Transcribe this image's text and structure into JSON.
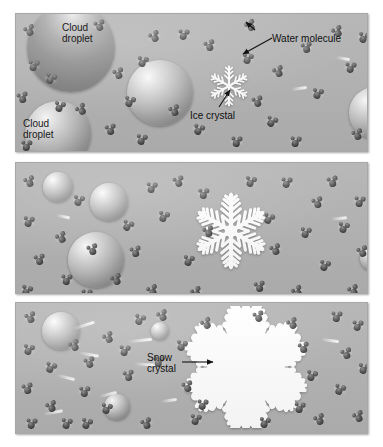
{
  "figure": {
    "type": "three-panel sequence diagram",
    "background_color": "#ffffff",
    "panel_fill": "#b3b3b3",
    "molecule_color": "#3c3c3c",
    "crystal_color": "#ffffff"
  },
  "panels": [
    {
      "id": "panel-1",
      "stage": "1",
      "caption": "Supercooled cloud droplets and water molecules surround a tiny ice crystal",
      "labels": [
        {
          "id": "cloud-droplet-1",
          "text": "Cloud\ndroplet",
          "line1": "Cloud",
          "line2": "droplet",
          "x": 62,
          "y": 22,
          "on_sphere": true,
          "font_size": 10
        },
        {
          "id": "cloud-droplet-2",
          "text": "Cloud\ndroplet",
          "line1": "Cloud",
          "line2": "droplet",
          "x": 23,
          "y": 118,
          "on_sphere": true,
          "font_size": 10
        },
        {
          "id": "water-molecule",
          "text": "Water molecule",
          "line1": "Water molecule",
          "line2": "",
          "x": 272,
          "y": 33,
          "on_sphere": false,
          "font_size": 10
        },
        {
          "id": "ice-crystal",
          "text": "Ice crystal",
          "line1": "Ice crystal",
          "line2": "",
          "x": 190,
          "y": 110,
          "on_sphere": false,
          "font_size": 10
        }
      ],
      "droplets": [
        {
          "cx": 70,
          "cy": 47,
          "r": 44,
          "shade": "bigdark"
        },
        {
          "cx": 159,
          "cy": 92,
          "r": 33,
          "shade": "light"
        },
        {
          "cx": 57,
          "cy": 133,
          "r": 33,
          "shade": "light"
        },
        {
          "cx": 374,
          "cy": 112,
          "r": 26,
          "shade": "light"
        }
      ],
      "crystal": {
        "cx": 228,
        "cy": 85,
        "size": 46,
        "kind": "simple-star"
      }
    },
    {
      "id": "panel-2",
      "stage": "2",
      "caption": "Droplets evaporate while the ice crystal grows by deposition",
      "labels": [],
      "droplets": [
        {
          "cx": 57,
          "cy": 186,
          "r": 15,
          "shade": "light"
        },
        {
          "cx": 108,
          "cy": 201,
          "r": 19,
          "shade": "light"
        },
        {
          "cx": 95,
          "cy": 259,
          "r": 28,
          "shade": "light"
        },
        {
          "cx": 372,
          "cy": 257,
          "r": 13,
          "shade": "light"
        }
      ],
      "crystal": {
        "cx": 230,
        "cy": 230,
        "size": 78,
        "kind": "dendrite"
      }
    },
    {
      "id": "panel-3",
      "stage": "3",
      "caption": "Droplets shrink to nothing as the large snow crystal forms",
      "labels": [
        {
          "id": "snow-crystal",
          "text": "Snow\ncrystal",
          "line1": "Snow",
          "line2": "crystal",
          "x": 147,
          "y": 352,
          "on_sphere": false,
          "font_size": 10
        }
      ],
      "droplets": [
        {
          "cx": 60,
          "cy": 330,
          "r": 19,
          "shade": "light"
        },
        {
          "cx": 159,
          "cy": 330,
          "r": 9,
          "shade": "light"
        },
        {
          "cx": 116,
          "cy": 406,
          "r": 13,
          "shade": "light"
        },
        {
          "cx": 376,
          "cy": 338,
          "r": 8,
          "shade": "light"
        }
      ],
      "crystal": {
        "cx": 245,
        "cy": 366,
        "size": 122,
        "kind": "stellar-dendrite"
      }
    }
  ],
  "geometry": {
    "panel_rects": [
      {
        "x": 15,
        "y": 13,
        "w": 353,
        "h": 139
      },
      {
        "x": 15,
        "y": 162,
        "w": 353,
        "h": 132
      },
      {
        "x": 15,
        "y": 302,
        "w": 353,
        "h": 132
      }
    ]
  },
  "leaders": [
    {
      "id": "leader-water-molecule",
      "x1": 272,
      "y1": 38,
      "x2": 243,
      "y2": 54,
      "head": "down-left"
    },
    {
      "id": "leader-water-molecule-2",
      "x1": 255,
      "y1": 30,
      "x2": 246,
      "y2": 22,
      "head": "up-left"
    },
    {
      "id": "leader-ice-crystal",
      "x1": 219,
      "y1": 107,
      "x2": 230,
      "y2": 90,
      "head": "up-right"
    },
    {
      "id": "leader-snow-crystal",
      "x1": 182,
      "y1": 362,
      "x2": 213,
      "y2": 362,
      "head": "right"
    }
  ],
  "molecules": {
    "panel1": [
      {
        "x": 23,
        "y": 25,
        "r": -18
      },
      {
        "x": 27,
        "y": 60,
        "r": 12
      },
      {
        "x": 16,
        "y": 92,
        "r": -8
      },
      {
        "x": 44,
        "y": 73,
        "r": 24
      },
      {
        "x": 75,
        "y": 104,
        "r": -30
      },
      {
        "x": 20,
        "y": 140,
        "r": 6
      },
      {
        "x": 53,
        "y": 101,
        "r": 18
      },
      {
        "x": 112,
        "y": 68,
        "r": -14
      },
      {
        "x": 123,
        "y": 96,
        "r": 20
      },
      {
        "x": 104,
        "y": 124,
        "r": -6
      },
      {
        "x": 135,
        "y": 134,
        "r": 14
      },
      {
        "x": 148,
        "y": 31,
        "r": -22
      },
      {
        "x": 177,
        "y": 29,
        "r": 10
      },
      {
        "x": 168,
        "y": 105,
        "r": -16
      },
      {
        "x": 192,
        "y": 124,
        "r": 22
      },
      {
        "x": 203,
        "y": 40,
        "r": -12
      },
      {
        "x": 230,
        "y": 136,
        "r": 8
      },
      {
        "x": 244,
        "y": 20,
        "r": -26
      },
      {
        "x": 241,
        "y": 53,
        "r": 16
      },
      {
        "x": 251,
        "y": 96,
        "r": -10
      },
      {
        "x": 265,
        "y": 116,
        "r": 26
      },
      {
        "x": 272,
        "y": 66,
        "r": -20
      },
      {
        "x": 289,
        "y": 136,
        "r": 12
      },
      {
        "x": 300,
        "y": 42,
        "r": -6
      },
      {
        "x": 311,
        "y": 88,
        "r": 18
      },
      {
        "x": 331,
        "y": 26,
        "r": -24
      },
      {
        "x": 344,
        "y": 62,
        "r": 10
      },
      {
        "x": 351,
        "y": 129,
        "r": -14
      },
      {
        "x": 357,
        "y": 32,
        "r": 20
      },
      {
        "x": 93,
        "y": 20,
        "r": -10
      },
      {
        "x": 136,
        "y": 56,
        "r": 16
      }
    ],
    "panel2": [
      {
        "x": 23,
        "y": 176,
        "r": -16
      },
      {
        "x": 22,
        "y": 216,
        "r": 14
      },
      {
        "x": 33,
        "y": 254,
        "r": -6
      },
      {
        "x": 20,
        "y": 285,
        "r": 22
      },
      {
        "x": 55,
        "y": 232,
        "r": -24
      },
      {
        "x": 60,
        "y": 274,
        "r": 8
      },
      {
        "x": 72,
        "y": 195,
        "r": 18
      },
      {
        "x": 86,
        "y": 244,
        "r": -12
      },
      {
        "x": 80,
        "y": 289,
        "r": 10
      },
      {
        "x": 110,
        "y": 274,
        "r": -20
      },
      {
        "x": 121,
        "y": 220,
        "r": 26
      },
      {
        "x": 129,
        "y": 246,
        "r": -8
      },
      {
        "x": 145,
        "y": 182,
        "r": 12
      },
      {
        "x": 146,
        "y": 285,
        "r": -18
      },
      {
        "x": 157,
        "y": 211,
        "r": 20
      },
      {
        "x": 172,
        "y": 176,
        "r": -10
      },
      {
        "x": 182,
        "y": 255,
        "r": 16
      },
      {
        "x": 190,
        "y": 287,
        "r": -22
      },
      {
        "x": 197,
        "y": 188,
        "r": 6
      },
      {
        "x": 202,
        "y": 226,
        "r": -14
      },
      {
        "x": 244,
        "y": 176,
        "r": 18
      },
      {
        "x": 253,
        "y": 281,
        "r": -6
      },
      {
        "x": 262,
        "y": 213,
        "r": 24
      },
      {
        "x": 269,
        "y": 244,
        "r": -16
      },
      {
        "x": 280,
        "y": 177,
        "r": 10
      },
      {
        "x": 291,
        "y": 286,
        "r": -26
      },
      {
        "x": 299,
        "y": 227,
        "r": 14
      },
      {
        "x": 311,
        "y": 197,
        "r": -12
      },
      {
        "x": 318,
        "y": 260,
        "r": 20
      },
      {
        "x": 326,
        "y": 176,
        "r": -8
      },
      {
        "x": 337,
        "y": 222,
        "r": 16
      },
      {
        "x": 347,
        "y": 285,
        "r": -20
      },
      {
        "x": 353,
        "y": 196,
        "r": 12
      },
      {
        "x": 356,
        "y": 246,
        "r": -14
      }
    ],
    "panel3": [
      {
        "x": 24,
        "y": 312,
        "r": -14
      },
      {
        "x": 22,
        "y": 344,
        "r": 18
      },
      {
        "x": 21,
        "y": 383,
        "r": -8
      },
      {
        "x": 25,
        "y": 418,
        "r": 10
      },
      {
        "x": 44,
        "y": 362,
        "r": 24
      },
      {
        "x": 45,
        "y": 401,
        "r": -18
      },
      {
        "x": 60,
        "y": 418,
        "r": 14
      },
      {
        "x": 68,
        "y": 340,
        "r": -22
      },
      {
        "x": 78,
        "y": 386,
        "r": 6
      },
      {
        "x": 80,
        "y": 418,
        "r": 20
      },
      {
        "x": 83,
        "y": 357,
        "r": -10
      },
      {
        "x": 100,
        "y": 403,
        "r": 16
      },
      {
        "x": 102,
        "y": 332,
        "r": -24
      },
      {
        "x": 118,
        "y": 345,
        "r": 12
      },
      {
        "x": 122,
        "y": 370,
        "r": -6
      },
      {
        "x": 133,
        "y": 314,
        "r": 22
      },
      {
        "x": 140,
        "y": 418,
        "r": -16
      },
      {
        "x": 152,
        "y": 356,
        "r": 8
      },
      {
        "x": 156,
        "y": 310,
        "r": -20
      },
      {
        "x": 175,
        "y": 340,
        "r": 18
      },
      {
        "x": 181,
        "y": 381,
        "r": -12
      },
      {
        "x": 189,
        "y": 414,
        "r": 14
      },
      {
        "x": 200,
        "y": 318,
        "r": -26
      },
      {
        "x": 196,
        "y": 399,
        "r": 10
      },
      {
        "x": 252,
        "y": 311,
        "r": -10
      },
      {
        "x": 258,
        "y": 417,
        "r": 16
      },
      {
        "x": 286,
        "y": 318,
        "r": -22
      },
      {
        "x": 293,
        "y": 402,
        "r": 12
      },
      {
        "x": 297,
        "y": 342,
        "r": -6
      },
      {
        "x": 305,
        "y": 370,
        "r": 20
      },
      {
        "x": 313,
        "y": 414,
        "r": -18
      },
      {
        "x": 330,
        "y": 311,
        "r": 8
      },
      {
        "x": 333,
        "y": 384,
        "r": 24
      },
      {
        "x": 340,
        "y": 348,
        "r": -14
      },
      {
        "x": 351,
        "y": 320,
        "r": 10
      },
      {
        "x": 352,
        "y": 411,
        "r": -20
      },
      {
        "x": 357,
        "y": 363,
        "r": 16
      }
    ]
  },
  "trails": [
    {
      "panel": 3,
      "x": 72,
      "y": 323,
      "w": 22,
      "r": -18
    },
    {
      "panel": 3,
      "x": 78,
      "y": 352,
      "w": 20,
      "r": 10
    },
    {
      "panel": 3,
      "x": 127,
      "y": 338,
      "w": 24,
      "r": -6
    },
    {
      "panel": 3,
      "x": 56,
      "y": 375,
      "w": 18,
      "r": 14
    },
    {
      "panel": 3,
      "x": 42,
      "y": 410,
      "w": 20,
      "r": -10
    },
    {
      "panel": 3,
      "x": 133,
      "y": 362,
      "w": 22,
      "r": 4
    },
    {
      "panel": 3,
      "x": 98,
      "y": 392,
      "w": 18,
      "r": -14
    },
    {
      "panel": 3,
      "x": 320,
      "y": 338,
      "w": 18,
      "r": 8
    },
    {
      "panel": 3,
      "x": 160,
      "y": 398,
      "w": 16,
      "r": -8
    },
    {
      "panel": 1,
      "x": 290,
      "y": 86,
      "w": 16,
      "r": -8
    },
    {
      "panel": 1,
      "x": 335,
      "y": 56,
      "w": 14,
      "r": 10
    },
    {
      "panel": 2,
      "x": 330,
      "y": 216,
      "w": 16,
      "r": -6
    },
    {
      "panel": 2,
      "x": 55,
      "y": 214,
      "w": 14,
      "r": 12
    }
  ]
}
